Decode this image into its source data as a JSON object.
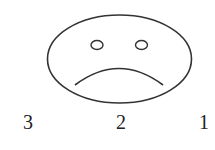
{
  "diagram": {
    "face": {
      "expression": "sad",
      "stroke_color": "#333333"
    },
    "labels": [
      {
        "text": "3",
        "x": 28
      },
      {
        "text": "2",
        "x": 121
      },
      {
        "text": "1",
        "x": 204
      }
    ]
  }
}
